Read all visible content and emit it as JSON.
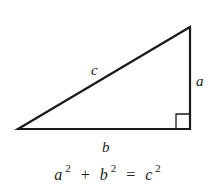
{
  "diagram": {
    "vertices": {
      "left": [
        18,
        129
      ],
      "top_right": [
        190,
        27
      ],
      "bottom_right": [
        190,
        129
      ]
    },
    "right_angle_marker_size": 14,
    "stroke_color": "#1a1a1a",
    "labels": {
      "hypotenuse": "c",
      "vertical_leg": "a",
      "horizontal_leg": "b"
    },
    "equation": {
      "term1_base": "a",
      "term1_exp": "2",
      "plus": "+",
      "term2_base": "b",
      "term2_exp": "2",
      "equals": "=",
      "term3_base": "c",
      "term3_exp": "2"
    }
  }
}
